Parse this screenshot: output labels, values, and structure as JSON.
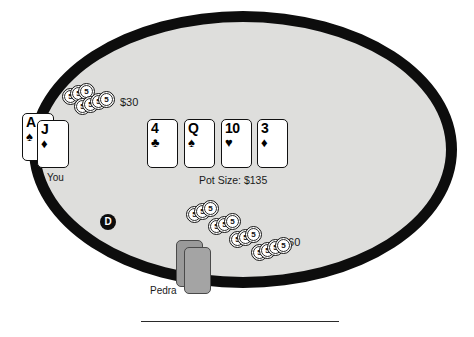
{
  "table": {
    "name": "poker-table",
    "felt_color": "#dededc",
    "border_color": "#0d0d0d",
    "background_color": "#ffffff"
  },
  "pot": {
    "label": "Pot Size: $135",
    "amount": 135,
    "currency": "$"
  },
  "dealer_button": {
    "label": "D"
  },
  "players": [
    {
      "name_label": "You",
      "seat": "left",
      "bet_label": "$30",
      "bet_amount": 30,
      "cards_face_up": true,
      "hole_cards": [
        {
          "rank": "A",
          "suit": "♠",
          "suit_name": "spades"
        },
        {
          "rank": "J",
          "suit": "♦",
          "suit_name": "diamonds"
        }
      ]
    },
    {
      "name_label": "Pedra",
      "seat": "bottom",
      "bet_label": "$60",
      "bet_amount": 60,
      "cards_face_up": false,
      "hole_cards": [
        {
          "rank": "",
          "suit": "",
          "suit_name": "face-down"
        },
        {
          "rank": "",
          "suit": "",
          "suit_name": "face-down"
        }
      ]
    }
  ],
  "community_cards": [
    {
      "rank": "4",
      "suit": "♣",
      "suit_name": "clubs"
    },
    {
      "rank": "Q",
      "suit": "♠",
      "suit_name": "spades"
    },
    {
      "rank": "10",
      "suit": "♥",
      "suit_name": "hearts"
    },
    {
      "rank": "3",
      "suit": "♦",
      "suit_name": "diamonds"
    }
  ],
  "chips": {
    "denomination_label": "5",
    "you_stack": [
      {
        "x": 62,
        "y": 88
      },
      {
        "x": 70,
        "y": 85
      },
      {
        "x": 78,
        "y": 83
      },
      {
        "x": 74,
        "y": 98
      },
      {
        "x": 82,
        "y": 96
      },
      {
        "x": 90,
        "y": 93
      },
      {
        "x": 98,
        "y": 91
      }
    ],
    "pedra_stack": [
      {
        "x": 186,
        "y": 206
      },
      {
        "x": 194,
        "y": 203
      },
      {
        "x": 202,
        "y": 200
      },
      {
        "x": 208,
        "y": 218
      },
      {
        "x": 216,
        "y": 216
      },
      {
        "x": 224,
        "y": 213
      },
      {
        "x": 229,
        "y": 231
      },
      {
        "x": 237,
        "y": 229
      },
      {
        "x": 245,
        "y": 226
      },
      {
        "x": 251,
        "y": 244
      },
      {
        "x": 259,
        "y": 242
      },
      {
        "x": 267,
        "y": 239
      },
      {
        "x": 275,
        "y": 237
      }
    ]
  },
  "divider": {
    "name": "bottom-divider"
  }
}
